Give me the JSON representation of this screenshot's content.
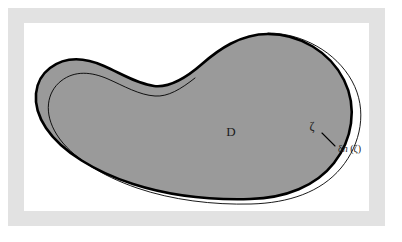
{
  "figure": {
    "kind": "math-diagram",
    "frame": {
      "mat_color": "#e2e2e2",
      "canvas_color": "#ffffff",
      "outer_background": "#ffffff"
    }
  },
  "shape": {
    "name": "domain-region",
    "fill_color": "#9a9a9a",
    "boundary_color": "#000000",
    "boundary_stroke_width": 2.6,
    "perturbed_boundary_color": "#000000",
    "perturbed_boundary_stroke_width": 0.9
  },
  "labels": {
    "domain": "D",
    "boundary_point": "ζ",
    "normal_displacement_delta": "δ",
    "normal_displacement_n": "n",
    "normal_displacement_arg": " (ζ)",
    "normal_displacement_full": "δn (ζ)"
  },
  "annotations": {
    "tick_label": "normal-displacement-tick"
  }
}
